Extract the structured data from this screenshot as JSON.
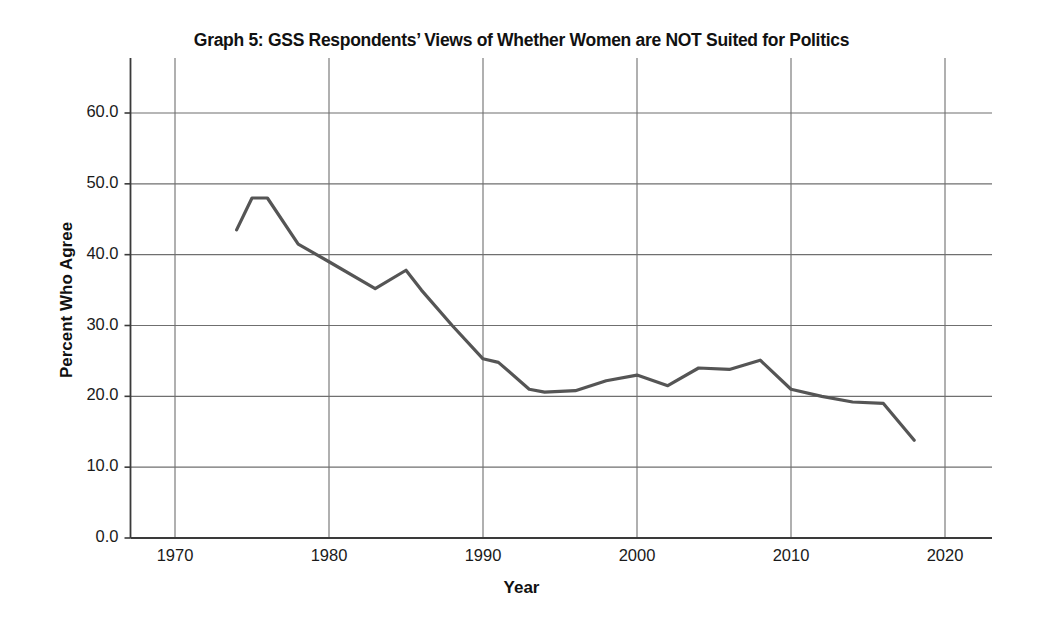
{
  "chart_data": {
    "type": "line",
    "title": "Graph 5: GSS Respondents’ Views of Whether Women are NOT Suited for Politics",
    "xlabel": "Year",
    "ylabel": "Percent Who Agree",
    "xlim": [
      1967.5,
      2023.5
    ],
    "ylim": [
      0.0,
      60.0
    ],
    "grid": true,
    "legend": "none",
    "line_color": "#555555",
    "xticks": [
      1970,
      1980,
      1990,
      2000,
      2010,
      2020
    ],
    "xtick_labels": [
      "1970",
      "1980",
      "1990",
      "2000",
      "2010",
      "2020"
    ],
    "yticks": [
      0.0,
      10.0,
      20.0,
      30.0,
      40.0,
      50.0,
      60.0
    ],
    "ytick_labels": [
      "0.0",
      "10.0",
      "20.0",
      "30.0",
      "40.0",
      "50.0",
      "60.0"
    ],
    "series": [
      {
        "name": "Percent Who Agree",
        "x": [
          1974,
          1975,
          1976,
          1978,
          1980,
          1983,
          1985,
          1986,
          1988,
          1990,
          1991,
          1993,
          1994,
          1996,
          1998,
          2000,
          2002,
          2004,
          2006,
          2008,
          2010,
          2012,
          2014,
          2016,
          2018
        ],
        "values": [
          43.5,
          48.0,
          48.0,
          41.5,
          39.0,
          35.2,
          37.8,
          35.0,
          30.0,
          25.3,
          24.8,
          21.0,
          20.6,
          20.8,
          22.2,
          23.0,
          21.5,
          24.0,
          23.8,
          25.1,
          21.0,
          20.0,
          19.2,
          19.0,
          13.8
        ]
      }
    ]
  }
}
